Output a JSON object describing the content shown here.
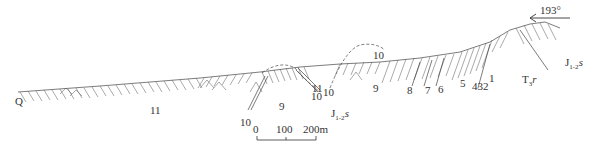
{
  "diagram": {
    "type": "geological-cross-section",
    "orientation": {
      "azimuth_label": "193°",
      "arrow_direction": "left"
    },
    "formations": [
      {
        "code": "Q",
        "label": "Q"
      },
      {
        "code": "J1-2s",
        "label_main": "J",
        "label_sub": "1-2",
        "label_suffix": "s"
      },
      {
        "code": "T3r",
        "label_main": "T",
        "label_sub": "3",
        "label_suffix": "r"
      }
    ],
    "layer_numbers": [
      {
        "id": "l11a",
        "text": "11",
        "x": 150,
        "y": 105
      },
      {
        "id": "l10a",
        "text": "10",
        "x": 240,
        "y": 117
      },
      {
        "id": "l9a",
        "text": "9",
        "x": 279,
        "y": 101
      },
      {
        "id": "l11b",
        "text": "11",
        "x": 312,
        "y": 83
      },
      {
        "id": "l10b",
        "text": "10",
        "x": 311,
        "y": 91
      },
      {
        "id": "l10c",
        "text": "10",
        "x": 323,
        "y": 87
      },
      {
        "id": "l10d",
        "text": "10",
        "x": 373,
        "y": 50
      },
      {
        "id": "l9b",
        "text": "9",
        "x": 373,
        "y": 83
      },
      {
        "id": "l8",
        "text": "8",
        "x": 407,
        "y": 85
      },
      {
        "id": "l7",
        "text": "7",
        "x": 425,
        "y": 85
      },
      {
        "id": "l6",
        "text": "6",
        "x": 438,
        "y": 84
      },
      {
        "id": "l5",
        "text": "5",
        "x": 460,
        "y": 78
      },
      {
        "id": "l432",
        "text": "432",
        "x": 472,
        "y": 81
      },
      {
        "id": "l1",
        "text": "1",
        "x": 489,
        "y": 73
      }
    ],
    "formation_positions": {
      "Q": {
        "x": 15,
        "y": 96
      },
      "J1-2s_bottom": {
        "x": 331,
        "y": 108
      },
      "J1-2s_right": {
        "x": 565,
        "y": 57
      },
      "T3r": {
        "x": 522,
        "y": 74
      }
    },
    "scale_bar": {
      "ticks": [
        "0",
        "100",
        "200m"
      ],
      "units": "m"
    },
    "colors": {
      "ink": "#333333",
      "background": "#ffffff"
    }
  }
}
